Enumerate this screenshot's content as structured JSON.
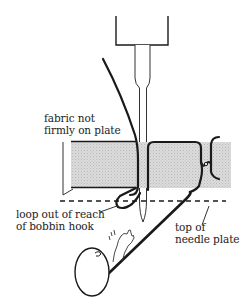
{
  "diagram": {
    "labels": {
      "fabric": {
        "line1": "fabric not",
        "line2": "firmly on plate"
      },
      "loop": {
        "line1": "loop out of reach",
        "line2": "of bobbin hook"
      },
      "plate": {
        "line1": "top of",
        "line2": "needle plate"
      }
    },
    "colors": {
      "ink": "#1a1a1a",
      "fabric_fill": "#d4d4d4",
      "background": "#ffffff"
    },
    "icons": [
      "needle-bar-icon",
      "needle-icon",
      "upper-thread-icon",
      "fabric-icon",
      "bobbin-icon",
      "lower-thread-icon",
      "waving-hand-icon"
    ]
  }
}
